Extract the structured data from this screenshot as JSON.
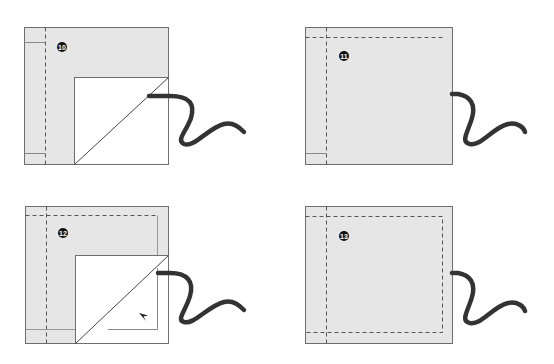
{
  "figure": {
    "colors": {
      "fabric": "#e6e6e6",
      "flap": "#ffffff",
      "outline": "#6e6e6e",
      "stitch": "#555555",
      "cord": "#333333",
      "badge": "#111111"
    },
    "steps": [
      {
        "number": "10",
        "label": "Step 10"
      },
      {
        "number": "11",
        "label": "Step 11"
      },
      {
        "number": "12",
        "label": "Step 12"
      },
      {
        "number": "13",
        "label": "Step 13"
      }
    ]
  }
}
